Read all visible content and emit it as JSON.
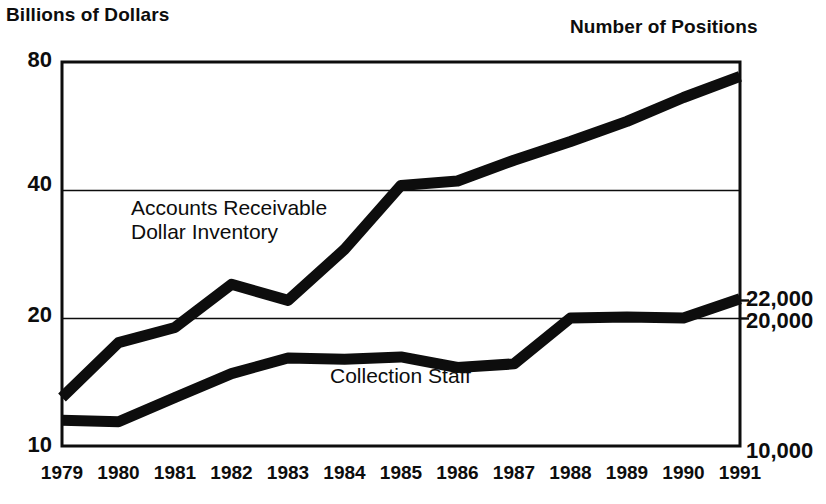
{
  "figure": {
    "left_axis_title": "Billions of Dollars",
    "right_axis_title": "Number of Positions",
    "background_color": "#ffffff",
    "ink_color": "#0d0d0d"
  },
  "chart_data": {
    "type": "line",
    "title": "",
    "xlabel": "",
    "ylabel": "Billions of Dollars",
    "y2label": "Number of Positions",
    "grid": true,
    "legend_position": "inline-annotation",
    "categories": [
      "1979",
      "1980",
      "1981",
      "1982",
      "1983",
      "1984",
      "1985",
      "1986",
      "1987",
      "1988",
      "1989",
      "1990",
      "1991"
    ],
    "x": [
      1979,
      1980,
      1981,
      1982,
      1983,
      1984,
      1985,
      1986,
      1987,
      1988,
      1989,
      1990,
      1991
    ],
    "left_axis": {
      "ticks": [
        "80",
        "40",
        "20",
        "10"
      ],
      "tick_values": [
        80,
        40,
        20,
        10
      ],
      "ylim": [
        10,
        80
      ],
      "scale": "log"
    },
    "right_axis": {
      "ticks": [
        "22,000",
        "20,000",
        "10,000"
      ],
      "tick_values": [
        22000,
        20000,
        10000
      ],
      "ylim": [
        10000,
        80000
      ],
      "scale": "log"
    },
    "series": [
      {
        "name": "Accounts Receivable Dollar Inventory",
        "label": "Accounts Receivable\nDollar Inventory",
        "axis": "left",
        "units": "Billions of Dollars",
        "values": [
          13.0,
          17.5,
          19.0,
          24.0,
          22.0,
          29.0,
          41.0,
          42.0,
          47.0,
          52.0,
          58.0,
          66.0,
          74.0
        ]
      },
      {
        "name": "Collection Staff",
        "label": "Collection Staff",
        "axis": "right",
        "units": "Number of Positions",
        "values": [
          11500,
          11400,
          13000,
          14800,
          16100,
          16000,
          16200,
          15300,
          15600,
          20000,
          20100,
          20000,
          22200
        ]
      }
    ]
  },
  "plot_geometry": {
    "left_px": 62,
    "right_px": 740,
    "top_px": 62,
    "bottom_px": 446,
    "gridline_40_px": 185,
    "gridline_20_px": 316,
    "line_width_px": 11,
    "frame_width_px": 3
  }
}
